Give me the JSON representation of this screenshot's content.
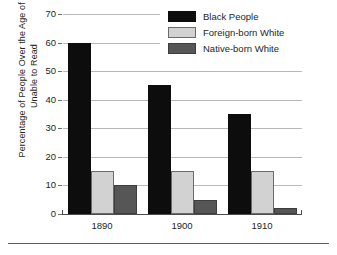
{
  "chart_data": {
    "type": "bar",
    "title": "",
    "subtitle": "",
    "xlabel": "",
    "ylabel": "Percentage of People Over the  Age of 9 Unable to Read",
    "ylabel_lines": [
      "Percentage of People Over the  Age of 9",
      "Unable to Read"
    ],
    "categories": [
      "1890",
      "1900",
      "1910"
    ],
    "series": [
      {
        "name": "Black People",
        "values": [
          60,
          45,
          35
        ],
        "color": "#0d0d0d"
      },
      {
        "name": "Foreign-born White",
        "values": [
          15,
          15,
          15
        ],
        "color": "#d2d2d2"
      },
      {
        "name": "Native-born White",
        "values": [
          10,
          5,
          2
        ],
        "color": "#565656"
      }
    ],
    "ylim": [
      0,
      70
    ],
    "ytick_values": [
      0,
      10,
      20,
      30,
      40,
      50,
      60,
      70
    ],
    "ytick_labels": [
      "0",
      "10",
      "20",
      "30",
      "40",
      "50",
      "60",
      "70"
    ],
    "grid": true,
    "grid_axis": "y",
    "legend_position": "top-right",
    "legend_entries": [
      "Black People",
      "Foreign-born White",
      "Native-born White"
    ]
  },
  "axes": {
    "y_title_line1": "Percentage of People Over the  Age of 9",
    "y_title_line2": "Unable to Read"
  },
  "colors": {
    "black_people": "#0d0d0d",
    "foreign_born_white": "#d2d2d2",
    "native_born_white": "#565656",
    "gridline": "#b8b8b8",
    "axis": "#4d4d4d",
    "text": "#231f20",
    "background": "#ffffff"
  }
}
